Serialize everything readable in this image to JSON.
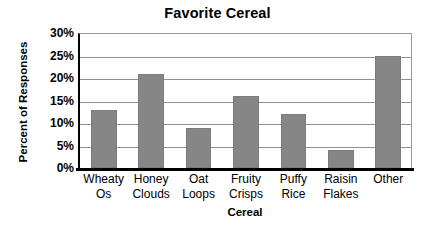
{
  "chart_data": {
    "type": "bar",
    "title": "Favorite Cereal",
    "xlabel": "Cereal",
    "ylabel": "Percent of Responses",
    "categories": [
      "Wheaty Os",
      "Honey Clouds",
      "Oat Loops",
      "Fruity Crisps",
      "Puffy Rice",
      "Raisin Flakes",
      "Other"
    ],
    "category_lines": [
      [
        "Wheaty",
        "Os"
      ],
      [
        "Honey",
        "Clouds"
      ],
      [
        "Oat",
        "Loops"
      ],
      [
        "Fruity",
        "Crisps"
      ],
      [
        "Puffy",
        "Rice"
      ],
      [
        "Raisin",
        "Flakes"
      ],
      [
        "Other",
        ""
      ]
    ],
    "values": [
      13,
      21,
      9,
      16,
      12,
      4,
      25
    ],
    "ylim": [
      0,
      30
    ],
    "ytick_values": [
      30,
      25,
      20,
      15,
      10,
      5,
      0
    ],
    "ytick_labels": [
      "30%",
      "25%",
      "20%",
      "15%",
      "10%",
      "5%",
      "0%"
    ],
    "grid": true,
    "legend": false,
    "bar_color": "#868686",
    "axis_color": "#000000",
    "gridline_color": "#8f8f8f",
    "background": "#ffffff"
  }
}
